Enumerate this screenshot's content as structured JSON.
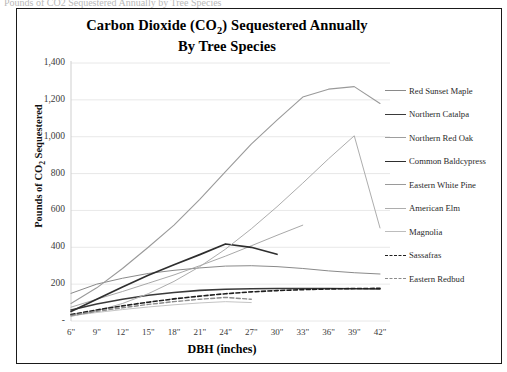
{
  "scan": {
    "top_clipped_text": "Pounds of CO2 Sequestered Annually by Tree Species"
  },
  "title": {
    "line1_prefix": "Carbon Dioxide (CO",
    "line1_sub": "2",
    "line1_suffix": ") Sequestered Annually",
    "line2": "By Tree Species"
  },
  "axes": {
    "x_title": "DBH (inches)",
    "y_title_prefix": "Pounds of CO",
    "y_title_sub": "2",
    "y_title_suffix": " Sequestered",
    "y_ticks": [
      "1,400",
      "1,200",
      "1,000",
      "800",
      "600",
      "400",
      "200",
      "-"
    ],
    "x_ticks": [
      "6\"",
      "9\"",
      "12\"",
      "15\"",
      "18\"",
      "21\"",
      "24\"",
      "27\"",
      "30\"",
      "33\"",
      "36\"",
      "39\"",
      "42\""
    ]
  },
  "chart_data": {
    "type": "line",
    "title": "Carbon Dioxide (CO2) Sequestered Annually By Tree Species",
    "xlabel": "DBH (inches)",
    "ylabel": "Pounds of CO2 Sequestered",
    "ylim": [
      0,
      1400
    ],
    "ytick_step": 200,
    "grid": true,
    "legend_position": "right",
    "categories": [
      "6\"",
      "9\"",
      "12\"",
      "15\"",
      "18\"",
      "21\"",
      "24\"",
      "27\"",
      "30\"",
      "33\"",
      "36\"",
      "39\"",
      "42\""
    ],
    "series": [
      {
        "name": "Red Sunset Maple",
        "color": "#8a8a8a",
        "width": 1.0,
        "dash": "none",
        "values": [
          150,
          200,
          232,
          258,
          275,
          288,
          298,
          300,
          295,
          285,
          272,
          262,
          255
        ]
      },
      {
        "name": "Northern Catalpa",
        "color": "#3a3a3a",
        "width": 1.6,
        "dash": "none",
        "values": [
          60,
          92,
          118,
          140,
          155,
          166,
          172,
          175,
          176,
          176,
          176,
          175,
          174
        ]
      },
      {
        "name": "Northern Red Oak",
        "color": "#9e9e9e",
        "width": 0.9,
        "dash": "none",
        "values": [
          75,
          118,
          160,
          205,
          250,
          300,
          352,
          408,
          465,
          520,
          null,
          null,
          null
        ]
      },
      {
        "name": "Common Baldcypress",
        "color": "#2e2e2e",
        "width": 1.7,
        "dash": "none",
        "values": [
          52,
          118,
          185,
          248,
          305,
          360,
          418,
          400,
          362,
          null,
          null,
          null,
          null
        ]
      },
      {
        "name": "Eastern White Pine",
        "color": "#9a9a9a",
        "width": 1.1,
        "dash": "none",
        "values": [
          95,
          180,
          285,
          400,
          520,
          660,
          810,
          960,
          1090,
          1215,
          1258,
          1272,
          1180
        ]
      },
      {
        "name": "American Elm",
        "color": "#adadad",
        "width": 1.0,
        "dash": "none",
        "values": [
          25,
          55,
          95,
          148,
          215,
          295,
          390,
          500,
          620,
          748,
          880,
          1005,
          505
        ]
      },
      {
        "name": "Magnolia",
        "color": "#bdbdbd",
        "width": 0.9,
        "dash": "none",
        "values": [
          28,
          46,
          62,
          76,
          88,
          98,
          105,
          100,
          null,
          null,
          null,
          null,
          null
        ]
      },
      {
        "name": "Sassafras",
        "color": "#1f1f1f",
        "width": 1.6,
        "dash": "4 2.4",
        "values": [
          35,
          60,
          82,
          102,
          120,
          135,
          148,
          158,
          165,
          170,
          174,
          176,
          177
        ]
      },
      {
        "name": "Eastern Redbud",
        "color": "#8c8c8c",
        "width": 1.4,
        "dash": "4 2.4",
        "values": [
          30,
          52,
          72,
          90,
          105,
          118,
          128,
          118,
          null,
          null,
          null,
          null,
          null
        ]
      }
    ]
  }
}
